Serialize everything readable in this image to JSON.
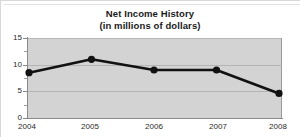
{
  "chart_data": {
    "type": "line",
    "title": "Net Income History",
    "subtitle": "(in millions of dollars)",
    "xlabel": "",
    "ylabel": "",
    "categories": [
      "2004",
      "2005",
      "2006",
      "2007",
      "2008"
    ],
    "values": [
      8.5,
      11.0,
      9.0,
      9.0,
      4.6
    ],
    "series": [
      {
        "name": "Net Income",
        "values": [
          8.5,
          11.0,
          9.0,
          9.0,
          4.6
        ]
      }
    ],
    "ylim": [
      0,
      15
    ],
    "y_ticks": [
      "0",
      "5",
      "10",
      "15"
    ],
    "y_tick_values": [
      0,
      5,
      10,
      15
    ],
    "y_minor_tick_values": [
      2.5,
      7.5,
      12.5
    ],
    "x_ticks": [
      "2004",
      "2005",
      "2006",
      "2007",
      "2008"
    ],
    "grid": true,
    "legend": false,
    "legend_position": "none",
    "marker": "circle",
    "colors": {
      "line": "#111111",
      "marker": "#111111",
      "plot_background": "#d3d3d3",
      "gridline": "#b4b4b4",
      "axis": "#8a8a8a",
      "text": "#1a1a1a"
    }
  }
}
